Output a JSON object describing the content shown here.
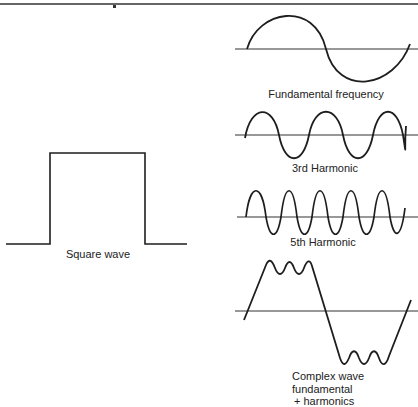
{
  "figure": {
    "panels": [
      {
        "id": "square",
        "label": "Square wave"
      },
      {
        "id": "fundamental",
        "label": "Fundamental frequency"
      },
      {
        "id": "third",
        "label": "3rd Harmonic"
      },
      {
        "id": "fifth",
        "label": "5th Harmonic"
      },
      {
        "id": "complex",
        "label_lines": [
          "Complex wave",
          "fundamental",
          "+ harmonics"
        ]
      }
    ],
    "colors": {
      "stroke": "#1e1e1e",
      "background": "#ffffff"
    }
  }
}
